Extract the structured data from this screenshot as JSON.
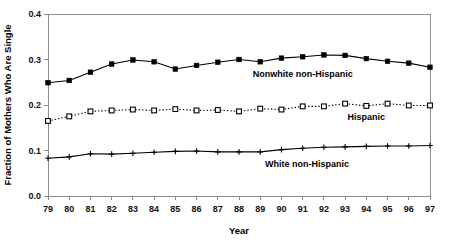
{
  "chart_data": {
    "type": "line",
    "title": "",
    "xlabel": "Year",
    "ylabel": "Fraction of Mothers Who Are Single",
    "categories": [
      "79",
      "80",
      "81",
      "82",
      "83",
      "84",
      "85",
      "86",
      "87",
      "88",
      "89",
      "90",
      "91",
      "92",
      "93",
      "94",
      "95",
      "96",
      "97"
    ],
    "x": [
      1979,
      1980,
      1981,
      1982,
      1983,
      1984,
      1985,
      1986,
      1987,
      1988,
      1989,
      1990,
      1991,
      1992,
      1993,
      1994,
      1995,
      1996,
      1997
    ],
    "xlim": [
      1979,
      1997
    ],
    "ylim": [
      0.0,
      0.4
    ],
    "yticks": [
      "0.0",
      "0.1",
      "0.2",
      "0.3",
      "0.4"
    ],
    "ytick_values": [
      0.0,
      0.1,
      0.2,
      0.3,
      0.4
    ],
    "grid": false,
    "legend": "inline-annotations",
    "series": [
      {
        "name": "Nonwhite non-Hispanic",
        "marker": "filled-square",
        "line": "solid",
        "color": "#000000",
        "annotation": "Nonwhite non-Hispanic",
        "values": [
          0.249,
          0.254,
          0.272,
          0.29,
          0.299,
          0.295,
          0.279,
          0.287,
          0.294,
          0.3,
          0.295,
          0.303,
          0.306,
          0.31,
          0.309,
          0.302,
          0.296,
          0.292,
          0.283
        ]
      },
      {
        "name": "Hispanic",
        "marker": "open-square",
        "line": "dotted",
        "color": "#000000",
        "annotation": "Hispanic",
        "values": [
          0.165,
          0.175,
          0.186,
          0.188,
          0.19,
          0.188,
          0.191,
          0.188,
          0.189,
          0.186,
          0.192,
          0.19,
          0.197,
          0.197,
          0.203,
          0.198,
          0.203,
          0.199,
          0.199
        ]
      },
      {
        "name": "White non-Hispanic",
        "marker": "plus",
        "line": "solid",
        "color": "#000000",
        "annotation": "White non-Hispanic",
        "values": [
          0.083,
          0.086,
          0.093,
          0.092,
          0.094,
          0.096,
          0.098,
          0.099,
          0.097,
          0.097,
          0.097,
          0.102,
          0.105,
          0.107,
          0.108,
          0.109,
          0.11,
          0.11,
          0.111
        ]
      }
    ],
    "annotations": [
      {
        "text": "Nonwhite non-Hispanic",
        "x": 1991.0,
        "y": 0.262,
        "anchor": "middle"
      },
      {
        "text": "Hispanic",
        "x": 1994.0,
        "y": 0.168,
        "anchor": "middle"
      },
      {
        "text": "White non-Hispanic",
        "x": 1991.2,
        "y": 0.063,
        "anchor": "middle"
      }
    ]
  },
  "axes": {
    "x_title": "Year",
    "y_title": "Fraction of Mothers Who Are Single"
  }
}
